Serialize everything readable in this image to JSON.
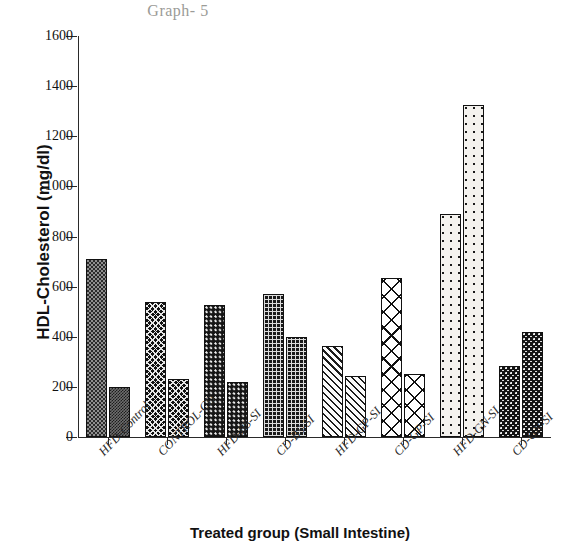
{
  "chart_data": {
    "type": "bar",
    "title": "Graph- 5",
    "xlabel": "Treated group (Small Intestine)",
    "ylabel": "HDL-Cholesterol (mg/dl)",
    "categories": [
      "HFD-Control",
      "CONTROL-CD",
      "HFD-BS-SI",
      "CD-BS-SI",
      "HFD-GP-SI",
      "CD-GP-SI",
      "HFD-GN-SI",
      "CD-GN-SI"
    ],
    "series": [
      {
        "name": "bar-a",
        "values": [
          710,
          540,
          525,
          570,
          365,
          635,
          890,
          285
        ]
      },
      {
        "name": "bar-b",
        "values": [
          200,
          230,
          220,
          400,
          245,
          250,
          1325,
          420
        ]
      }
    ],
    "ylim": [
      0,
      1600
    ],
    "yticks": [
      0,
      200,
      400,
      600,
      800,
      1000,
      1200,
      1400,
      1600
    ],
    "ytick_labels": [
      "0",
      "200",
      "400",
      "600",
      "800",
      "1000",
      "1200",
      "1400",
      "1600"
    ],
    "grid": false,
    "legend": "none",
    "bar_patterns": [
      [
        "checker-gray",
        "checker-dark"
      ],
      [
        "xhatch-small",
        "xhatch-small"
      ],
      [
        "dots-dark",
        "dots-dark"
      ],
      [
        "grid-dot",
        "grid-dot"
      ],
      [
        "diag",
        "diag"
      ],
      [
        "xhatch-big",
        "xhatch-big"
      ],
      [
        "sparse-dots",
        "sparse-dots"
      ],
      [
        "speckle",
        "speckle"
      ]
    ]
  }
}
